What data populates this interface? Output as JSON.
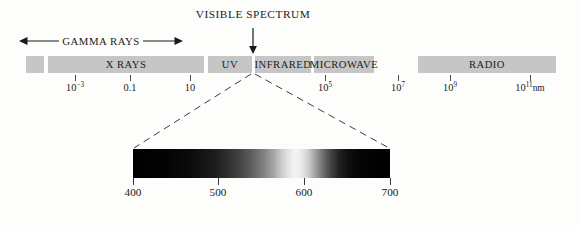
{
  "diagram": {
    "band_color": "#c6c6c6",
    "background_color": "#fdfdfb"
  },
  "callout": {
    "label": "VISIBLE SPECTRUM",
    "arrow_icon": "down-arrow-icon",
    "target_x": 253
  },
  "gamma": {
    "label": "GAMMA RAYS",
    "left_arrow_icon": "left-arrow-icon",
    "right_arrow_icon": "right-arrow-icon"
  },
  "band": {
    "segments": [
      {
        "label": "",
        "name": "band-segment-unlabeled",
        "left": 26,
        "width": 18
      },
      {
        "label": "X RAYS",
        "name": "band-segment-x-rays",
        "left": 48,
        "width": 156
      },
      {
        "label": "UV",
        "name": "band-segment-uv",
        "left": 208,
        "width": 44
      },
      {
        "label": "INFRARED",
        "name": "band-segment-infrared",
        "left": 255,
        "width": 56
      },
      {
        "label": "MICROWAVE",
        "name": "band-segment-microwave",
        "left": 314,
        "width": 60
      },
      {
        "label": "RADIO",
        "name": "band-segment-radio",
        "left": 418,
        "width": 138
      }
    ],
    "ticks": [
      {
        "x": 75,
        "mantissa": "10",
        "exponent": "−3",
        "suffix": "",
        "name": "band-tick-10e-3"
      },
      {
        "x": 130,
        "mantissa": "0.1",
        "exponent": "",
        "suffix": "",
        "name": "band-tick-0-1"
      },
      {
        "x": 190,
        "mantissa": "10",
        "exponent": "",
        "suffix": "",
        "name": "band-tick-10"
      },
      {
        "x": 325,
        "mantissa": "10",
        "exponent": "5",
        "suffix": "",
        "name": "band-tick-10e5"
      },
      {
        "x": 398,
        "mantissa": "10",
        "exponent": "7",
        "suffix": "",
        "name": "band-tick-10e7"
      },
      {
        "x": 450,
        "mantissa": "10",
        "exponent": "9",
        "suffix": "",
        "name": "band-tick-10e9"
      },
      {
        "x": 530,
        "mantissa": "10",
        "exponent": "11",
        "suffix": "nm",
        "name": "band-tick-10e11-nm"
      }
    ]
  },
  "visible_bar": {
    "ticks": [
      {
        "x": 133,
        "label": "400",
        "name": "visible-tick-400"
      },
      {
        "x": 218,
        "label": "500",
        "name": "visible-tick-500"
      },
      {
        "x": 304,
        "label": "600",
        "name": "visible-tick-600"
      },
      {
        "x": 390,
        "label": "700",
        "name": "visible-tick-700"
      }
    ],
    "wavelength_unit": "nm",
    "range_start": 400,
    "range_end": 700
  },
  "chart_data": {
    "type": "bar",
    "xlabel": "Wavelength (nm)",
    "ylabel": "",
    "categories": [
      "",
      "X RAYS",
      "UV",
      "INFRARED",
      "MICROWAVE",
      "RADIO"
    ],
    "axis_scale": "log10",
    "tick_labels": [
      "10−3",
      "0.1",
      "10",
      "10⁵",
      "10⁷",
      "10⁹",
      "10¹¹nm"
    ],
    "annotations": [
      "GAMMA RAYS",
      "VISIBLE SPECTRUM"
    ],
    "inset": {
      "type": "area",
      "title": "Visible spectrum",
      "x": [
        400,
        500,
        600,
        700
      ],
      "xlabel": "Wavelength (nm)",
      "xlim": [
        400,
        700
      ]
    },
    "grid": false,
    "legend": "none"
  }
}
